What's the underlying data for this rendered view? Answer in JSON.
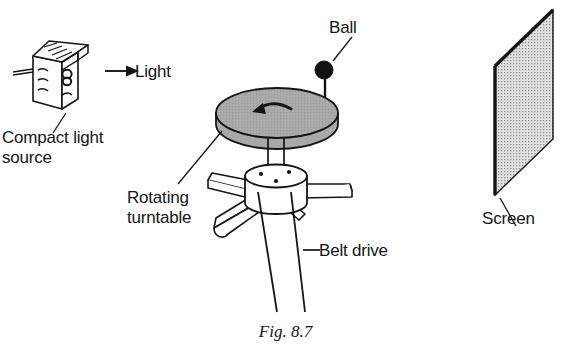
{
  "figure": {
    "caption": "Fig. 8.7",
    "background_color": "#ffffff",
    "ink_color": "#151515"
  },
  "labels": {
    "compact_light_source": "Compact light\nsource",
    "light": "Light",
    "ball": "Ball",
    "rotating_turntable": "Rotating\nturntable",
    "belt_drive": "Belt drive",
    "screen": "Screen"
  },
  "parts": [
    {
      "name": "compact-light-source",
      "icon": "lamp-housing-icon",
      "label": "Compact light source",
      "fill": "#ffffff",
      "stroke": "#151515"
    },
    {
      "name": "light-beam-arrow",
      "icon": "arrow-right-icon",
      "label": "Light",
      "stroke": "#151515"
    },
    {
      "name": "ball",
      "icon": "ball-icon",
      "label": "Ball",
      "fill": "#111111"
    },
    {
      "name": "rotating-turntable",
      "icon": "turntable-disc-icon",
      "label": "Rotating turntable",
      "fill": "#a9a9a9",
      "stroke": "#151515",
      "rotation_arrow": "curved-arrow-icon"
    },
    {
      "name": "belt-drive",
      "icon": "belt-lines-icon",
      "label": "Belt drive",
      "stroke": "#151515"
    },
    {
      "name": "screen",
      "icon": "screen-panel-icon",
      "label": "Screen",
      "fill": "#d6d6d6",
      "stroke": "#151515"
    }
  ]
}
